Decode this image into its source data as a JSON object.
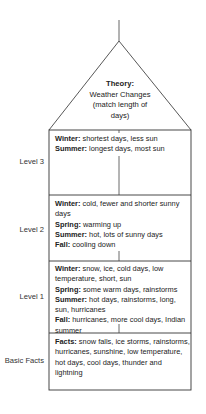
{
  "theory": {
    "label": "Theory:",
    "line1": "Weather Changes",
    "line2": "(match length of",
    "line3": "days)"
  },
  "levels": [
    {
      "label": "Level 3",
      "entries": [
        {
          "key": "Winter:",
          "text": " shortest days, less sun"
        },
        {
          "key": "Summer:",
          "text": " longest days, most sun"
        }
      ]
    },
    {
      "label": "Level 2",
      "entries": [
        {
          "key": "Winter:",
          "text": " cold, fewer and shorter sunny days"
        },
        {
          "key": "Spring:",
          "text": " warming up"
        },
        {
          "key": "Summer:",
          "text": " hot, lots of sunny days"
        },
        {
          "key": "Fall:",
          "text": " cooling down"
        }
      ]
    },
    {
      "label": "Level 1",
      "entries": [
        {
          "key": "Winter:",
          "text": " snow, ice, cold days, low temperature, short, sun"
        },
        {
          "key": "Spring:",
          "text": " some warm days, rainstorms"
        },
        {
          "key": "Summer:",
          "text": " hot days, rainstorms, long, sun, hurricanes"
        },
        {
          "key": "Fall:",
          "text": " hurricanes, more cool days, Indian summer"
        }
      ]
    },
    {
      "label": "Basic Facts",
      "entries": [
        {
          "key": "Facts:",
          "text": " snow falls, ice storms, rainstorms, hurricanes, sunshine, low temperature, hot days, cool days, thunder and lightning"
        }
      ]
    }
  ],
  "colors": {
    "line": "#333333",
    "text": "#222222",
    "background": "#ffffff"
  }
}
